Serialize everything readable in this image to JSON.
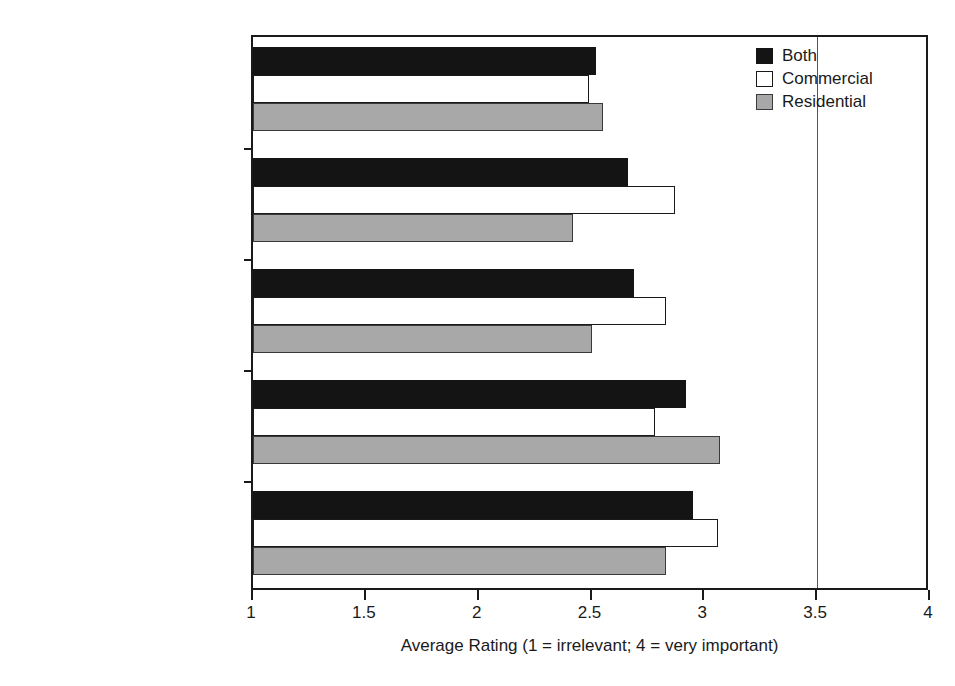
{
  "chart_data": {
    "type": "bar",
    "orientation": "horizontal",
    "title": "",
    "xlabel": "Average Rating (1 = irrelevant; 4 = very important)",
    "ylabel": "",
    "xlim": [
      1,
      4
    ],
    "xticks": [
      1,
      1.5,
      2,
      2.5,
      3,
      3.5,
      4
    ],
    "xtick_labels": [
      "1",
      "1.5",
      "2",
      "2.5",
      "3",
      "3.5",
      "4"
    ],
    "grid": false,
    "gridlines_at": [
      3.5
    ],
    "legend_position": "top-right",
    "categories": [
      "Remediation",
      "Choice of materials",
      "Construction",
      "Masterplan/site layout",
      "Building design"
    ],
    "series": [
      {
        "name": "Both",
        "color": "#141414",
        "values": [
          2.52,
          2.66,
          2.69,
          2.92,
          2.95
        ]
      },
      {
        "name": "Commercial",
        "color": "#ffffff",
        "values": [
          2.49,
          2.87,
          2.83,
          2.78,
          3.06
        ]
      },
      {
        "name": "Residential",
        "color": "#a8a8a8",
        "values": [
          2.55,
          2.42,
          2.5,
          3.07,
          2.83
        ]
      }
    ]
  },
  "legend": {
    "items": [
      {
        "label": "Both",
        "key": "both"
      },
      {
        "label": "Commercial",
        "key": "commercial"
      },
      {
        "label": "Residential",
        "key": "residential"
      }
    ]
  }
}
